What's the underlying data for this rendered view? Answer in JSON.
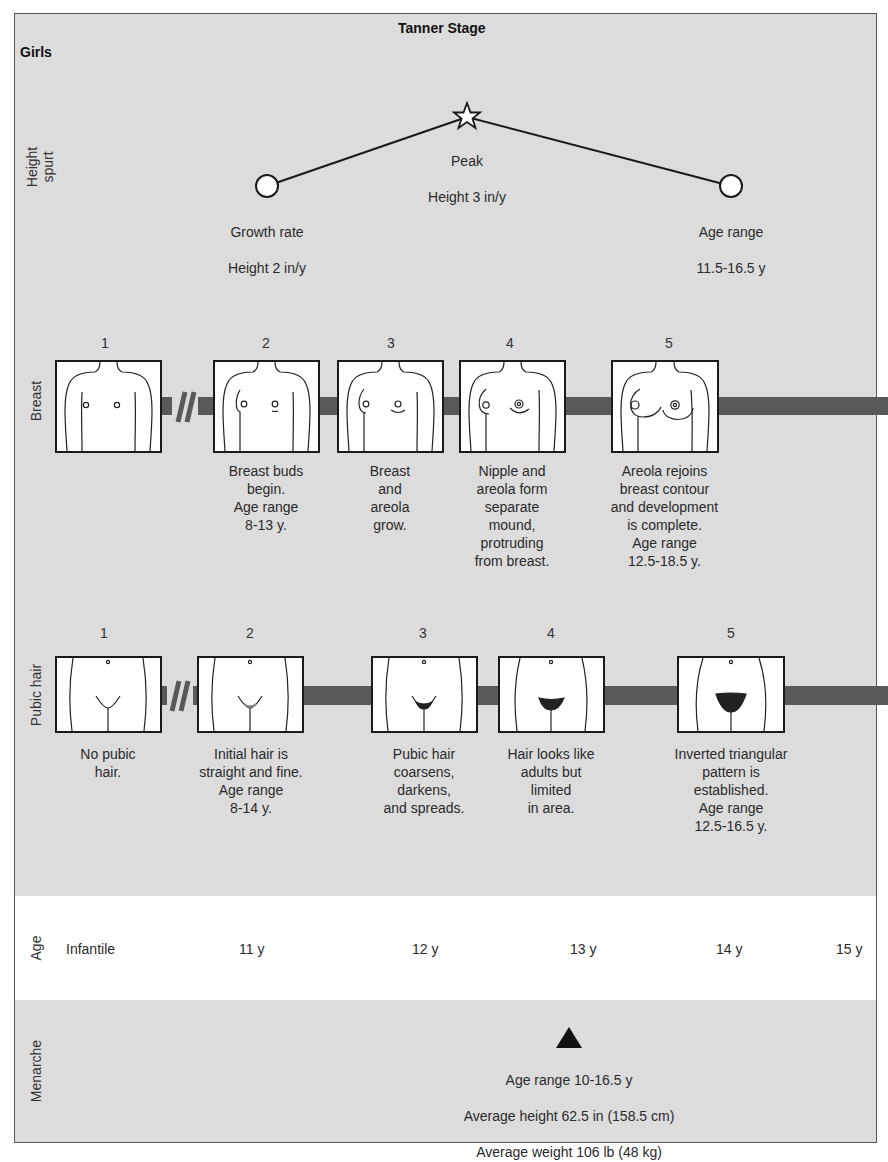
{
  "header": {
    "title": "Tanner Stage",
    "subject": "Girls"
  },
  "rows": {
    "height_spurt": "Height\nspurt",
    "breast": "Breast",
    "pubic_hair": "Pubic hair",
    "age": "Age",
    "menarche": "Menarche"
  },
  "height_spurt": {
    "start": {
      "line1": "Growth rate",
      "line2": "Height 2 in/y",
      "marker": "circle-icon"
    },
    "peak": {
      "line1": "Peak",
      "line2": "Height 3 in/y",
      "marker": "star-icon"
    },
    "end": {
      "line1": "Age range",
      "line2": "11.5-16.5 y",
      "marker": "circle-icon"
    }
  },
  "breast": {
    "stages": [
      {
        "num": "1",
        "text": ""
      },
      {
        "num": "2",
        "text": "Breast buds\nbegin.\nAge range\n8-13 y."
      },
      {
        "num": "3",
        "text": "Breast\nand\nareola\ngrow."
      },
      {
        "num": "4",
        "text": "Nipple and\nareola form\nseparate\nmound,\nprotruding\nfrom breast."
      },
      {
        "num": "5",
        "text": "Areola rejoins\nbreast contour\nand development\nis complete.\nAge range\n12.5-18.5 y."
      }
    ]
  },
  "pubic_hair": {
    "stages": [
      {
        "num": "1",
        "text": "No pubic\nhair."
      },
      {
        "num": "2",
        "text": "Initial hair is\nstraight and fine.\nAge range\n8-14 y."
      },
      {
        "num": "3",
        "text": "Pubic hair\ncoarsens,\ndarkens,\nand spreads."
      },
      {
        "num": "4",
        "text": "Hair looks like\nadults but\nlimited\nin area."
      },
      {
        "num": "5",
        "text": "Inverted triangular\npattern is\nestablished.\nAge range\n12.5-16.5 y."
      }
    ]
  },
  "age_axis": {
    "labels": [
      "Infantile",
      "11 y",
      "12 y",
      "13 y",
      "14 y",
      "15 y"
    ]
  },
  "menarche": {
    "marker": "triangle-icon",
    "line1": "Age range 10-16.5 y",
    "line2": "Average height 62.5 in (158.5 cm)",
    "line3": "Average weight 106 lb (48 kg)"
  },
  "colors": {
    "panel_bg": "#dcdcdc",
    "bar": "#595959",
    "age_band": "#ffffff",
    "border": "#555555"
  }
}
